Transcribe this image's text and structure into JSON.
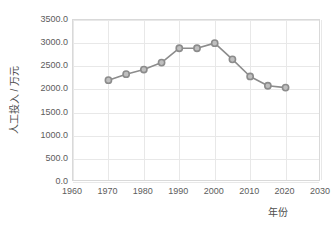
{
  "chart_data": {
    "type": "line",
    "title": "",
    "xlabel": "年份",
    "ylabel": "人工投入 / 万元",
    "xlim": [
      1960,
      2030
    ],
    "ylim": [
      0,
      3500
    ],
    "xticks": [
      "1960",
      "1970",
      "1980",
      "1990",
      "2000",
      "2010",
      "2020",
      "2030"
    ],
    "xtick_values": [
      1960,
      1970,
      1980,
      1990,
      2000,
      2010,
      2020,
      2030
    ],
    "yticks": [
      "0.0",
      "500.0",
      "1000.0",
      "1500.0",
      "2000.0",
      "2500.0",
      "3000.0",
      "3500.0"
    ],
    "ytick_values": [
      0,
      500,
      1000,
      1500,
      2000,
      2500,
      3000,
      3500
    ],
    "grid": true,
    "legend": "none",
    "x": [
      1970,
      1975,
      1980,
      1985,
      1990,
      1995,
      2000,
      2005,
      2010,
      2015,
      2020
    ],
    "values": [
      2200,
      2330,
      2430,
      2580,
      2890,
      2890,
      3000,
      2650,
      2280,
      2080,
      2040
    ],
    "series": [
      {
        "name": "人工投入",
        "x": [
          1970,
          1975,
          1980,
          1985,
          1990,
          1995,
          2000,
          2005,
          2010,
          2015,
          2020
        ],
        "values": [
          2200,
          2330,
          2430,
          2580,
          2890,
          2890,
          3000,
          2650,
          2280,
          2080,
          2040
        ]
      }
    ],
    "marker": "open-circle",
    "colors": {
      "line": "#8c8c8c",
      "marker_face": "#bfbfbf",
      "marker_edge": "#8c8c8c",
      "grid": "#e8e8e8",
      "frame": "#d9d9d9",
      "tick_text": "#5c5c5c",
      "axis_title": "#4d4d4d",
      "background": "#ffffff"
    }
  }
}
